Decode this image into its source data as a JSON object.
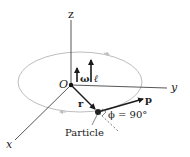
{
  "diagram": {
    "axes": {
      "z": "z",
      "y": "y",
      "x": "x"
    },
    "origin_label": "O",
    "angular_velocity_label": "ω",
    "angular_momentum_label": "ℓ",
    "position_vector_label": "r",
    "momentum_label": "p",
    "angle_label": "ϕ = 90°",
    "particle_label": "Particle",
    "colors": {
      "axis": "#444444",
      "orbit": "#bdbdbd",
      "vector": "#1a1a1a",
      "text": "#222222"
    }
  }
}
